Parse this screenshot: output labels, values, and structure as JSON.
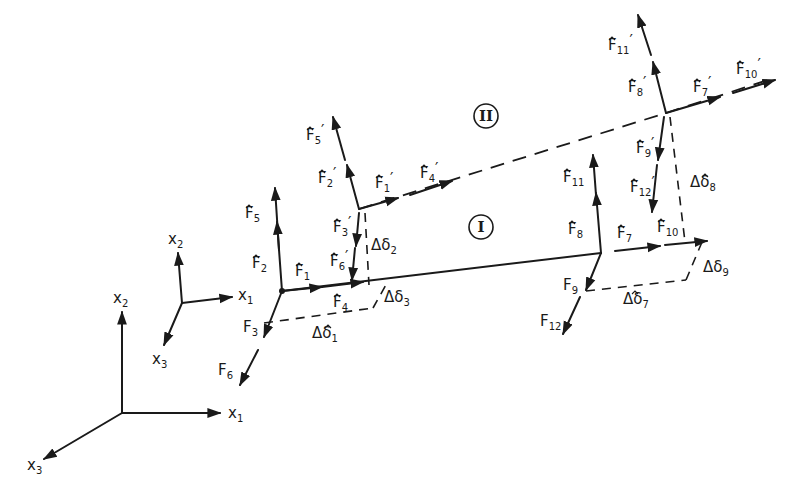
{
  "diagram": {
    "type": "structural-element-force-diagram",
    "regions": [
      {
        "id": "I",
        "label": "I"
      },
      {
        "id": "II",
        "label": "II"
      }
    ],
    "global_axes": {
      "x1": "x",
      "x1_sub": "1",
      "x2": "x",
      "x2_sub": "2",
      "x3": "x",
      "x3_sub": "3"
    },
    "local_axes": {
      "x1": "x",
      "x1_sub": "1",
      "x2": "x",
      "x2_sub": "2",
      "x3": "x",
      "x3_sub": "3"
    },
    "forces_element_I": [
      {
        "name": "F",
        "sub": "1",
        "prime": ""
      },
      {
        "name": "F",
        "sub": "2",
        "prime": ""
      },
      {
        "name": "F",
        "sub": "3",
        "prime": ""
      },
      {
        "name": "F",
        "sub": "4",
        "prime": ""
      },
      {
        "name": "F",
        "sub": "5",
        "prime": ""
      },
      {
        "name": "F",
        "sub": "6",
        "prime": ""
      },
      {
        "name": "F",
        "sub": "7",
        "prime": ""
      },
      {
        "name": "F",
        "sub": "8",
        "prime": ""
      },
      {
        "name": "F",
        "sub": "9",
        "prime": ""
      },
      {
        "name": "F",
        "sub": "10",
        "prime": ""
      },
      {
        "name": "F",
        "sub": "11",
        "prime": ""
      },
      {
        "name": "F",
        "sub": "12",
        "prime": ""
      }
    ],
    "forces_element_II": [
      {
        "name": "F",
        "sub": "1",
        "prime": "′"
      },
      {
        "name": "F",
        "sub": "2",
        "prime": "′"
      },
      {
        "name": "F",
        "sub": "3",
        "prime": "′"
      },
      {
        "name": "F",
        "sub": "4",
        "prime": "′"
      },
      {
        "name": "F",
        "sub": "5",
        "prime": "′"
      },
      {
        "name": "F",
        "sub": "6",
        "prime": "′"
      },
      {
        "name": "F",
        "sub": "7",
        "prime": "′"
      },
      {
        "name": "F",
        "sub": "8",
        "prime": "′"
      },
      {
        "name": "F",
        "sub": "9",
        "prime": "′"
      },
      {
        "name": "F",
        "sub": "10",
        "prime": "′"
      },
      {
        "name": "F",
        "sub": "11",
        "prime": "′"
      },
      {
        "name": "F",
        "sub": "12",
        "prime": "′"
      }
    ],
    "displacements": [
      {
        "name": "Δδ",
        "sub": "1"
      },
      {
        "name": "Δδ",
        "sub": "2"
      },
      {
        "name": "Δδ",
        "sub": "3"
      },
      {
        "name": "Δδ",
        "sub": "7"
      },
      {
        "name": "Δδ",
        "sub": "8"
      },
      {
        "name": "Δδ",
        "sub": "9"
      }
    ],
    "hat": "^"
  }
}
